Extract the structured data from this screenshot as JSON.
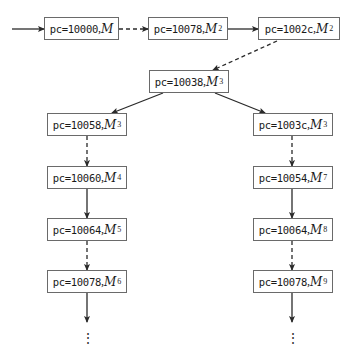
{
  "diagram": {
    "title": "",
    "entry_arrow": {
      "from": [
        12,
        29
      ],
      "to": [
        44,
        29
      ],
      "style": "solid"
    },
    "nodes": [
      {
        "id": "n1",
        "pc": "pc=10000",
        "sep": ",",
        "mem": "M",
        "sup": "",
        "x": 44,
        "y": 17,
        "w": 75
      },
      {
        "id": "n2",
        "pc": "pc=10078",
        "sep": ",",
        "mem": "M",
        "sup": "2",
        "x": 148,
        "y": 17,
        "w": 80
      },
      {
        "id": "n3",
        "pc": "pc=1002c",
        "sep": ",",
        "mem": "M",
        "sup": "2",
        "x": 258,
        "y": 17,
        "w": 82
      },
      {
        "id": "n4",
        "pc": "pc=10038",
        "sep": ",",
        "mem": "M",
        "sup": "3",
        "x": 149,
        "y": 70,
        "w": 80
      },
      {
        "id": "n5",
        "pc": "pc=10058",
        "sep": ",",
        "mem": "M",
        "sup": "3",
        "x": 47,
        "y": 113,
        "w": 80
      },
      {
        "id": "n6",
        "pc": "pc=1003c",
        "sep": ",",
        "mem": "M",
        "sup": "3",
        "x": 253,
        "y": 113,
        "w": 80
      },
      {
        "id": "n7",
        "pc": "pc=10060",
        "sep": ",",
        "mem": "M",
        "sup": "4",
        "x": 47,
        "y": 166,
        "w": 80
      },
      {
        "id": "n8",
        "pc": "pc=10054",
        "sep": ",",
        "mem": "M",
        "sup": "7",
        "x": 253,
        "y": 166,
        "w": 80
      },
      {
        "id": "n9",
        "pc": "pc=10064",
        "sep": ",",
        "mem": "M",
        "sup": "5",
        "x": 47,
        "y": 218,
        "w": 80
      },
      {
        "id": "n10",
        "pc": "pc=10064",
        "sep": ",",
        "mem": "M",
        "sup": "8",
        "x": 253,
        "y": 218,
        "w": 80
      },
      {
        "id": "n11",
        "pc": "pc=10078",
        "sep": ",",
        "mem": "M",
        "sup": "6",
        "x": 47,
        "y": 270,
        "w": 80
      },
      {
        "id": "n12",
        "pc": "pc=10078",
        "sep": ",",
        "mem": "M",
        "sup": "9",
        "x": 253,
        "y": 270,
        "w": 80
      }
    ],
    "edges": [
      {
        "from": "n1",
        "to": "n2",
        "style": "dashed",
        "x1": 119,
        "y1": 29,
        "x2": 148,
        "y2": 29
      },
      {
        "from": "n2",
        "to": "n3",
        "style": "solid",
        "x1": 228,
        "y1": 29,
        "x2": 258,
        "y2": 29
      },
      {
        "from": "n3",
        "to": "n4",
        "style": "dashed",
        "x1": 277,
        "y1": 41,
        "x2": 213,
        "y2": 70
      },
      {
        "from": "n4",
        "to": "n5",
        "style": "solid",
        "x1": 163,
        "y1": 93,
        "x2": 112,
        "y2": 113
      },
      {
        "from": "n4",
        "to": "n6",
        "style": "solid",
        "x1": 215,
        "y1": 93,
        "x2": 265,
        "y2": 113
      },
      {
        "from": "n5",
        "to": "n7",
        "style": "dashed",
        "x1": 87,
        "y1": 136,
        "x2": 87,
        "y2": 166
      },
      {
        "from": "n6",
        "to": "n8",
        "style": "dashed",
        "x1": 292,
        "y1": 136,
        "x2": 292,
        "y2": 166
      },
      {
        "from": "n7",
        "to": "n9",
        "style": "solid",
        "x1": 87,
        "y1": 189,
        "x2": 87,
        "y2": 218
      },
      {
        "from": "n8",
        "to": "n10",
        "style": "solid",
        "x1": 292,
        "y1": 189,
        "x2": 292,
        "y2": 218
      },
      {
        "from": "n9",
        "to": "n11",
        "style": "dashed",
        "x1": 87,
        "y1": 241,
        "x2": 87,
        "y2": 270
      },
      {
        "from": "n10",
        "to": "n12",
        "style": "dashed",
        "x1": 292,
        "y1": 241,
        "x2": 292,
        "y2": 270
      },
      {
        "from": "n11",
        "to": "more_left",
        "style": "solid",
        "x1": 87,
        "y1": 293,
        "x2": 87,
        "y2": 322
      },
      {
        "from": "n12",
        "to": "more_right",
        "style": "solid",
        "x1": 292,
        "y1": 293,
        "x2": 292,
        "y2": 322
      }
    ],
    "continuation": [
      {
        "symbol": "⋮",
        "x": 87,
        "y": 330
      },
      {
        "symbol": "⋮",
        "x": 292,
        "y": 330
      }
    ],
    "colors": {
      "line": "#2a2a2a",
      "box_border": "#6a6a6a",
      "text": "#1a1a1a",
      "background": "#ffffff"
    }
  }
}
